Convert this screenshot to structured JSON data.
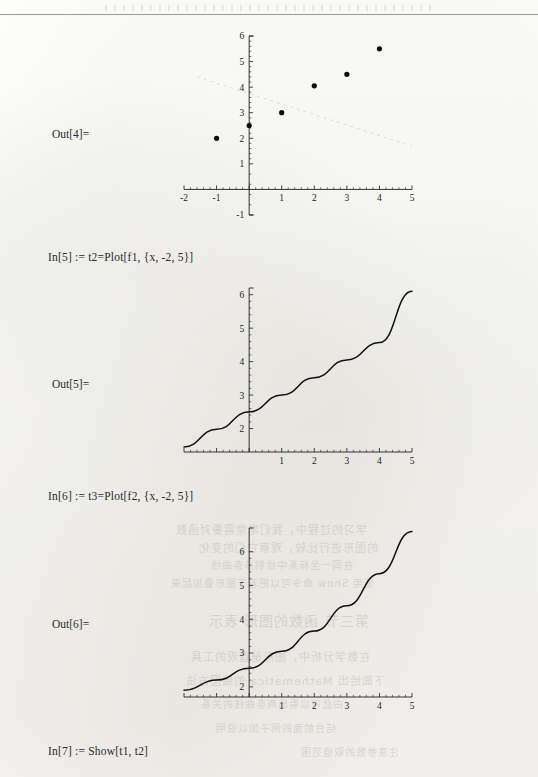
{
  "page": {
    "kind": "mathematica-notebook-scan",
    "width": 538,
    "height": 777,
    "ink_color": "#1d1d1d",
    "paper_color": "#fdfdfb"
  },
  "cells": [
    {
      "id": "out4",
      "label": "Out[4]=",
      "kind": "graphics"
    },
    {
      "id": "in5",
      "label": "In[5] :=",
      "code": "t2=Plot[f1, {x, -2, 5}]",
      "full": "In[5] := t2=Plot[f1, {x, -2, 5}]"
    },
    {
      "id": "out5",
      "label": "Out[5]=",
      "kind": "graphics"
    },
    {
      "id": "in6",
      "label": "In[6] :=",
      "code": "t3=Plot[f2, {x, -2, 5}]",
      "full": "In[6] := t3=Plot[f2, {x, -2, 5}]"
    },
    {
      "id": "out6",
      "label": "Out[6]=",
      "kind": "graphics"
    },
    {
      "id": "in7",
      "label": "In[7] :=",
      "code": "Show[t1, t2]",
      "full": "In[7] := Show[t1, t2]"
    }
  ],
  "chart_data": [
    {
      "id": "out4",
      "type": "scatter",
      "title": "",
      "xlabel": "",
      "ylabel": "",
      "xlim": [
        -2,
        5
      ],
      "ylim": [
        -1,
        6
      ],
      "xticks": [
        -2,
        -1,
        0,
        1,
        2,
        3,
        4,
        5
      ],
      "xticklabels": [
        "-2",
        "-1",
        "",
        "1",
        "2",
        "3",
        "4",
        "5"
      ],
      "yticks": [
        -1,
        1,
        2,
        3,
        4,
        5,
        6
      ],
      "yticklabels": [
        "-1",
        "1",
        "2",
        "3",
        "4",
        "5",
        "6"
      ],
      "grid": false,
      "legend": "none",
      "points": [
        {
          "x": -1,
          "y": 2.0
        },
        {
          "x": 0,
          "y": 2.5
        },
        {
          "x": 1,
          "y": 3.0
        },
        {
          "x": 2,
          "y": 4.05
        },
        {
          "x": 3,
          "y": 4.5
        },
        {
          "x": 4,
          "y": 5.5
        }
      ]
    },
    {
      "id": "out5",
      "type": "line",
      "title": "",
      "xlabel": "",
      "ylabel": "",
      "xlim": [
        -2,
        5
      ],
      "ylim": [
        1.3,
        6.2
      ],
      "xticks": [
        -2,
        -1,
        0,
        1,
        2,
        3,
        4,
        5
      ],
      "xticklabels": [
        "",
        "",
        "",
        "1",
        "2",
        "3",
        "4",
        "5"
      ],
      "yticks": [
        2,
        3,
        4,
        5,
        6
      ],
      "yticklabels": [
        "2",
        "3",
        "4",
        "5",
        "6"
      ],
      "grid": false,
      "legend": "none",
      "expression": "f1 = 2.5 + 0.5 x",
      "series": [
        {
          "name": "f1",
          "x": [
            -2,
            -1,
            0,
            1,
            2,
            3,
            4,
            5
          ],
          "values": [
            1.45,
            1.98,
            2.5,
            3.0,
            3.52,
            4.05,
            4.57,
            6.1
          ]
        }
      ]
    },
    {
      "id": "out6",
      "type": "line",
      "title": "",
      "xlabel": "",
      "ylabel": "",
      "xlim": [
        -2,
        5
      ],
      "ylim": [
        1.7,
        6.7
      ],
      "xticks": [
        -2,
        -1,
        0,
        1,
        2,
        3,
        4,
        5
      ],
      "xticklabels": [
        "",
        "",
        "",
        "1",
        "2",
        "3",
        "4",
        "5"
      ],
      "yticks": [
        2,
        3,
        4,
        5,
        6
      ],
      "yticklabels": [
        "2",
        "3",
        "4",
        "5",
        "6"
      ],
      "grid": false,
      "legend": "none",
      "expression": "f2 (convex, increasing)",
      "series": [
        {
          "name": "f2",
          "x": [
            -2,
            -1,
            0,
            1,
            2,
            3,
            4,
            5
          ],
          "values": [
            1.9,
            2.2,
            2.55,
            3.05,
            3.65,
            4.4,
            5.35,
            6.6
          ]
        }
      ]
    }
  ],
  "bleed_through": [
    {
      "text": "学习的过程中，我们常常需要对函数",
      "x": 175,
      "y": 521,
      "size": 11
    },
    {
      "text": "的图形进行比较，观察它们的变化",
      "x": 198,
      "y": 539,
      "size": 11
    },
    {
      "text": "在同一坐标系中绘制多条曲线",
      "x": 210,
      "y": 557,
      "size": 10
    },
    {
      "text": "使用 Show 命令可以把若干图形叠加起来",
      "x": 170,
      "y": 575,
      "size": 10
    },
    {
      "text": "第三节 函数的图形 表示",
      "x": 208,
      "y": 610,
      "size": 14
    },
    {
      "text": "在数学分析中，图形是直观的工具",
      "x": 190,
      "y": 648,
      "size": 11
    },
    {
      "text": "下面给出 Mathematica 的绘图方法",
      "x": 185,
      "y": 672,
      "size": 11
    },
    {
      "text": "由此可以看出两条曲线的关系",
      "x": 200,
      "y": 696,
      "size": 10
    },
    {
      "text": "结合前面的例子加以说明",
      "x": 215,
      "y": 720,
      "size": 10
    },
    {
      "text": "注意参数的取值范围",
      "x": 300,
      "y": 744,
      "size": 10
    }
  ]
}
